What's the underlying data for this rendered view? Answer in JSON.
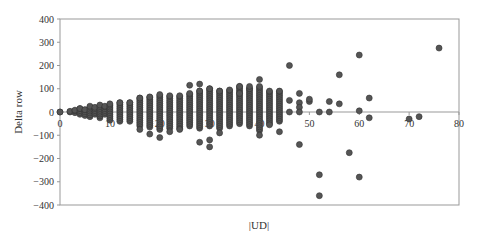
{
  "chart_data": {
    "type": "scatter",
    "title": "",
    "xlabel": "|UD|",
    "ylabel": "Delta row",
    "xlim": [
      0,
      80
    ],
    "ylim": [
      -400,
      400
    ],
    "xticks": [
      0,
      10,
      20,
      30,
      40,
      50,
      60,
      70,
      80
    ],
    "yticks": [
      400,
      300,
      200,
      100,
      0,
      -100,
      -200,
      -300,
      -400
    ],
    "grid": false,
    "legend": null,
    "marker_color": "#555555",
    "marker_edge": "#333333",
    "axis_color": "#999999",
    "columns": [
      {
        "x": 0,
        "min": 0,
        "max": 0
      },
      {
        "x": 2,
        "min": 0,
        "max": 3
      },
      {
        "x": 3,
        "min": -3,
        "max": 8
      },
      {
        "x": 4,
        "min": -10,
        "max": 15
      },
      {
        "x": 5,
        "min": -15,
        "max": 10
      },
      {
        "x": 6,
        "min": -20,
        "max": 25
      },
      {
        "x": 7,
        "min": -10,
        "max": 20
      },
      {
        "x": 8,
        "min": -25,
        "max": 30
      },
      {
        "x": 9,
        "min": -10,
        "max": 25
      },
      {
        "x": 10,
        "min": -35,
        "max": 35
      },
      {
        "x": 12,
        "min": -40,
        "max": 40
      },
      {
        "x": 14,
        "min": -40,
        "max": 40
      },
      {
        "x": 16,
        "min": -60,
        "max": 60
      },
      {
        "x": 18,
        "min": -65,
        "max": 65
      },
      {
        "x": 20,
        "min": -75,
        "max": 75
      },
      {
        "x": 22,
        "min": -70,
        "max": 70
      },
      {
        "x": 24,
        "min": -70,
        "max": 70
      },
      {
        "x": 26,
        "min": -60,
        "max": 80
      },
      {
        "x": 28,
        "min": -70,
        "max": 90
      },
      {
        "x": 30,
        "min": -60,
        "max": 100
      },
      {
        "x": 32,
        "min": -70,
        "max": 90
      },
      {
        "x": 34,
        "min": -60,
        "max": 95
      },
      {
        "x": 36,
        "min": -50,
        "max": 110
      },
      {
        "x": 38,
        "min": -60,
        "max": 100
      },
      {
        "x": 40,
        "min": -80,
        "max": 110
      },
      {
        "x": 42,
        "min": -50,
        "max": 90
      },
      {
        "x": 44,
        "min": -40,
        "max": 90
      }
    ],
    "points": [
      {
        "x": 0,
        "y": 0
      },
      {
        "x": 16,
        "y": -75
      },
      {
        "x": 18,
        "y": -95
      },
      {
        "x": 20,
        "y": -110
      },
      {
        "x": 22,
        "y": -85
      },
      {
        "x": 24,
        "y": -75
      },
      {
        "x": 26,
        "y": 115
      },
      {
        "x": 28,
        "y": 120
      },
      {
        "x": 28,
        "y": -130
      },
      {
        "x": 30,
        "y": -150
      },
      {
        "x": 30,
        "y": -120
      },
      {
        "x": 32,
        "y": -90
      },
      {
        "x": 36,
        "y": 80
      },
      {
        "x": 38,
        "y": 110
      },
      {
        "x": 40,
        "y": 140
      },
      {
        "x": 40,
        "y": -100
      },
      {
        "x": 42,
        "y": -55
      },
      {
        "x": 44,
        "y": -85
      },
      {
        "x": 46,
        "y": 200
      },
      {
        "x": 46,
        "y": 50
      },
      {
        "x": 46,
        "y": 0
      },
      {
        "x": 48,
        "y": -140
      },
      {
        "x": 48,
        "y": 80
      },
      {
        "x": 48,
        "y": 40
      },
      {
        "x": 48,
        "y": 20
      },
      {
        "x": 48,
        "y": 0
      },
      {
        "x": 50,
        "y": 45
      },
      {
        "x": 50,
        "y": 55
      },
      {
        "x": 52,
        "y": 0
      },
      {
        "x": 52,
        "y": -270
      },
      {
        "x": 52,
        "y": -360
      },
      {
        "x": 54,
        "y": 45
      },
      {
        "x": 54,
        "y": 0
      },
      {
        "x": 56,
        "y": 160
      },
      {
        "x": 56,
        "y": 35
      },
      {
        "x": 58,
        "y": -175
      },
      {
        "x": 60,
        "y": 245
      },
      {
        "x": 60,
        "y": 5
      },
      {
        "x": 60,
        "y": -280
      },
      {
        "x": 62,
        "y": 60
      },
      {
        "x": 62,
        "y": -25
      },
      {
        "x": 70,
        "y": -30
      },
      {
        "x": 72,
        "y": -20
      },
      {
        "x": 76,
        "y": 275
      }
    ]
  }
}
